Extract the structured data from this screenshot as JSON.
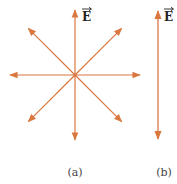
{
  "figure": {
    "panel_a": {
      "caption": "(a)",
      "field_label": "E",
      "description": "Electric field vectors radiating outward from a point in all directions (8 arrows)",
      "arrow_directions_deg": [
        90,
        45,
        0,
        -45,
        -90,
        -135,
        180,
        135
      ]
    },
    "panel_b": {
      "caption": "(b)",
      "field_label": "E",
      "description": "Double-headed vertical electric field vector"
    },
    "colors": {
      "arrow": "#d9773f",
      "text": "#333333"
    }
  }
}
